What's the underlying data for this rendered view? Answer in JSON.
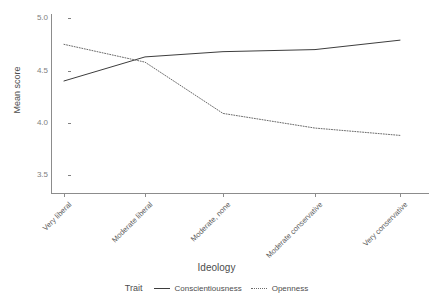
{
  "chart_data": {
    "type": "line",
    "title": "",
    "xlabel": "Ideology",
    "ylabel": "Mean score",
    "categories": [
      "Very liberal",
      "Moderate liberal",
      "Moderate, none",
      "Moderate conservative",
      "Very conservative"
    ],
    "series": [
      {
        "name": "Conscientiousness",
        "linestyle": "solid",
        "color": "#3d3d3d",
        "values": [
          4.4,
          4.63,
          4.68,
          4.7,
          4.79
        ]
      },
      {
        "name": "Openness",
        "linestyle": "dotted",
        "color": "#6b6b6b",
        "values": [
          4.75,
          4.58,
          4.09,
          3.95,
          3.88
        ]
      }
    ],
    "ylim": [
      3.32,
      5.04
    ],
    "yticks": [
      3.5,
      4.0,
      4.5,
      5.0
    ],
    "ytick_labels": [
      "3.5",
      "4.0",
      "4.5",
      "5.0"
    ],
    "grid": false,
    "legend": {
      "title": "Trait",
      "position": "bottom",
      "entries": [
        "Conscientiousness",
        "Openness"
      ]
    }
  }
}
